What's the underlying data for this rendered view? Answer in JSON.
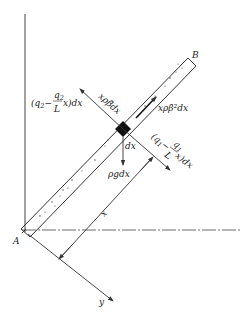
{
  "diagram": {
    "type": "free-body diagram of inclined bar element",
    "points": {
      "A": "A",
      "B": "B"
    },
    "axes": {
      "x_label": "x",
      "y_label": "y"
    },
    "forces": {
      "left_distributed": "(q₂−(q₂/L)x)dx",
      "left_distributed_parts": {
        "open": "(q",
        "sub1": "2",
        "minus": "−",
        "frac_num": "q",
        "frac_num_sub": "2",
        "frac_den": "L",
        "tail": "x)dx"
      },
      "right_distributed_parts": {
        "open": "(q",
        "sub1": "1",
        "minus": "−",
        "frac_num": "q",
        "frac_num_sub": "1",
        "frac_den": "L",
        "tail": "x)dx"
      },
      "tangential_inertia": "xρβ̈dx",
      "centrifugal": "xρβ̇²dx",
      "gravity": "ρgdx",
      "element_length": "dx"
    },
    "colors": {
      "line": "#333333",
      "element": "#111111",
      "background": "#ffffff"
    }
  }
}
